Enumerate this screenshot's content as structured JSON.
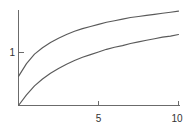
{
  "chart_data": {
    "type": "line",
    "title": "",
    "subtitle": "",
    "xlabel": "",
    "ylabel": "",
    "xlim": [
      0,
      10
    ],
    "ylim": [
      0,
      1.78
    ],
    "grid": false,
    "legend": "none",
    "background_color": "#ffffff",
    "axis_color": "#6b6b6b",
    "curve_color": "#5a5a5a",
    "label_color": "#333333",
    "x_ticks": [
      {
        "value": 5,
        "label": "5"
      },
      {
        "value": 10,
        "label": "10"
      }
    ],
    "y_ticks": [
      {
        "value": 1,
        "label": "1"
      }
    ],
    "x": [
      0,
      0.5,
      1,
      1.5,
      2,
      2.5,
      3,
      3.5,
      4,
      4.5,
      5,
      5.5,
      6,
      6.5,
      7,
      7.5,
      8,
      8.5,
      9,
      9.5,
      10
    ],
    "series": [
      {
        "name": "upper-curve",
        "values": [
          0.55,
          0.79,
          0.97,
          1.09,
          1.19,
          1.27,
          1.34,
          1.4,
          1.45,
          1.49,
          1.53,
          1.57,
          1.6,
          1.63,
          1.66,
          1.68,
          1.7,
          1.72,
          1.74,
          1.76,
          1.78
        ]
      },
      {
        "name": "lower-curve",
        "values": [
          0.0,
          0.2,
          0.37,
          0.5,
          0.61,
          0.7,
          0.78,
          0.85,
          0.91,
          0.96,
          1.01,
          1.06,
          1.1,
          1.13,
          1.17,
          1.2,
          1.23,
          1.26,
          1.29,
          1.31,
          1.34
        ]
      }
    ]
  },
  "axes": {
    "y_axis_name": "y-axis",
    "x_axis_name": "x-axis"
  }
}
